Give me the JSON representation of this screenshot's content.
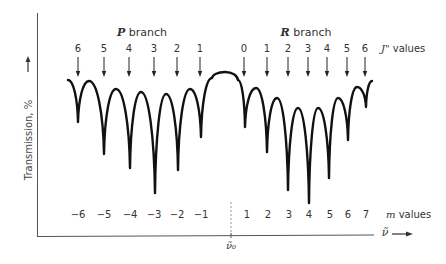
{
  "chart_data": {
    "type": "line",
    "title": "",
    "ylabel": "Transmission, %",
    "xlabel": "ν̃",
    "center_label": "ν̃₀",
    "p_branch": {
      "title_italic": "P",
      "title_rest": " branch",
      "j_values": [
        "6",
        "5",
        "4",
        "3",
        "2",
        "1"
      ],
      "j_x": [
        78,
        104,
        129,
        154,
        177,
        200
      ],
      "m_values": [
        "−6",
        "−5",
        "−4",
        "−3",
        "−2",
        "−1"
      ],
      "m_x": [
        78,
        104,
        130,
        154,
        177,
        201
      ],
      "relative_depth": [
        0.42,
        0.65,
        0.77,
        1.0,
        0.8,
        0.45
      ]
    },
    "r_branch": {
      "title_italic": "R",
      "title_rest": " branch",
      "j_values": [
        "0",
        "1",
        "2",
        "3",
        "4",
        "5",
        "6"
      ],
      "j_x": [
        244,
        267,
        288,
        308,
        327,
        347,
        365
      ],
      "m_values": [
        "1",
        "2",
        "3",
        "4",
        "5",
        "6",
        "7"
      ],
      "m_x": [
        247,
        268,
        289,
        309,
        330,
        348,
        366
      ],
      "relative_depth": [
        0.45,
        0.62,
        0.88,
        1.0,
        0.78,
        0.52,
        0.2
      ]
    },
    "j_label_italic": "J\"",
    "j_label_rest": " values",
    "m_label_italic": "m",
    "m_label_rest": " values",
    "curve_points": [
      [
        68,
        80
      ],
      [
        78,
        122
      ],
      [
        89,
        81
      ],
      [
        104,
        154
      ],
      [
        116,
        89
      ],
      [
        130,
        168
      ],
      [
        141,
        92
      ],
      [
        155,
        193
      ],
      [
        166,
        94
      ],
      [
        178,
        170
      ],
      [
        190,
        89
      ],
      [
        201,
        137
      ],
      [
        212,
        78
      ],
      [
        225,
        72
      ],
      [
        238,
        80
      ],
      [
        245,
        127
      ],
      [
        256,
        88
      ],
      [
        267,
        152
      ],
      [
        277,
        98
      ],
      [
        288,
        190
      ],
      [
        298,
        108
      ],
      [
        309,
        203
      ],
      [
        318,
        108
      ],
      [
        329,
        178
      ],
      [
        338,
        98
      ],
      [
        348,
        140
      ],
      [
        357,
        87
      ],
      [
        366,
        107
      ],
      [
        372,
        81
      ]
    ],
    "grid": false,
    "legend": "none"
  }
}
